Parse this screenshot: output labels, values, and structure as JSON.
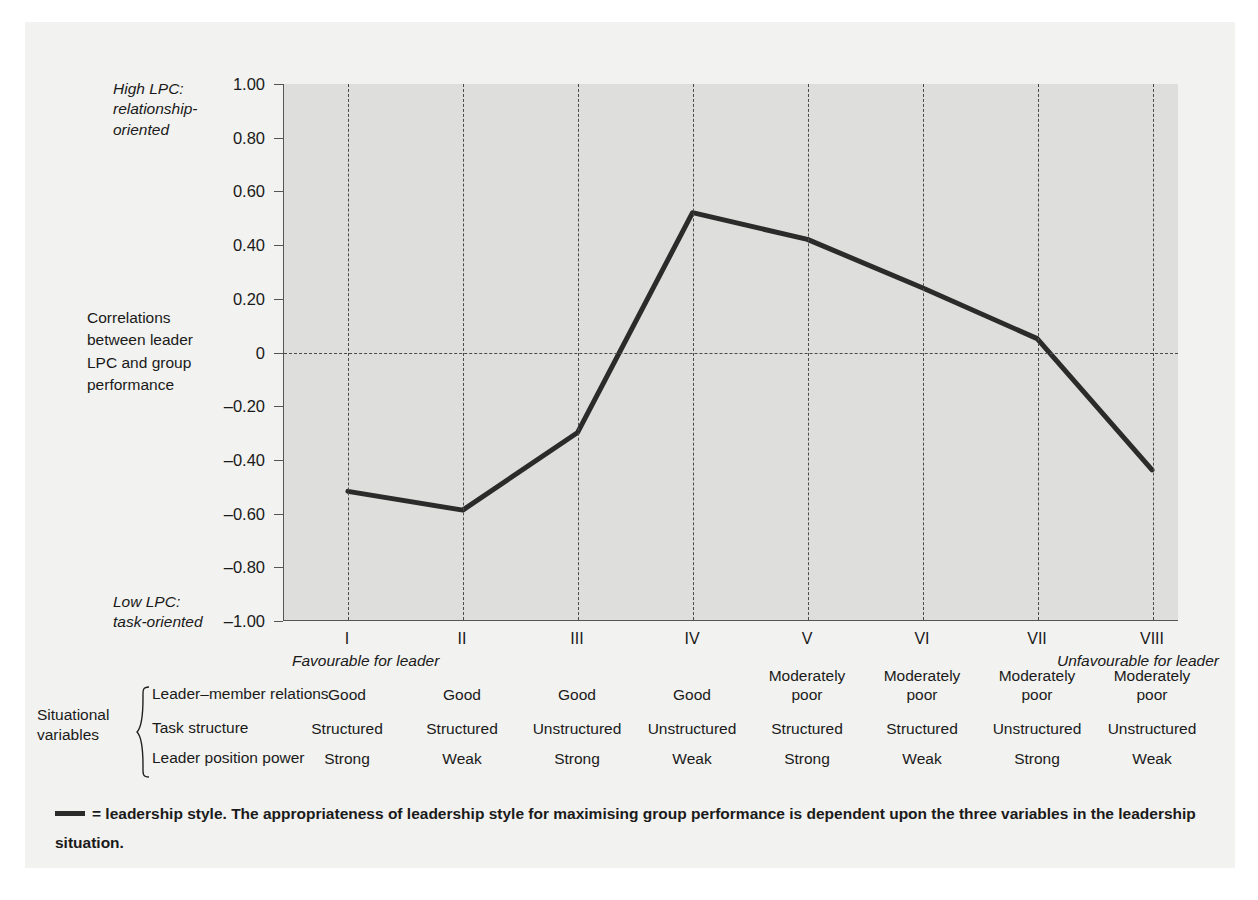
{
  "chart_data": {
    "type": "line",
    "title": "",
    "xlabel": "",
    "ylabel": "Correlations between leader LPC and group performance",
    "categories": [
      "I",
      "II",
      "III",
      "IV",
      "V",
      "VI",
      "VII",
      "VIII"
    ],
    "series": [
      {
        "name": "leadership style",
        "values": [
          -0.52,
          -0.59,
          -0.3,
          0.52,
          0.42,
          0.24,
          0.05,
          -0.44
        ]
      }
    ],
    "ylim": [
      -1.0,
      1.0
    ],
    "yticks": [
      "1.00",
      "0.80",
      "0.60",
      "0.40",
      "0.20",
      "0",
      "-0.20",
      "-0.40",
      "-0.60",
      "-0.80",
      "-1.00"
    ],
    "ytick_values": [
      1.0,
      0.8,
      0.6,
      0.4,
      0.2,
      0,
      -0.2,
      -0.4,
      -0.6,
      -0.8,
      -1.0
    ],
    "grid": "vertical dashed at each category, horizontal dashed at zero",
    "legend": "none",
    "annotations": {
      "y_top": "High LPC:\nrelationship-\noriented",
      "y_middle": "Correlations\nbetween leader\nLPC and group\nperformance",
      "y_bottom": "Low LPC:\ntask-oriented",
      "x_left": "Favourable for leader",
      "x_right": "Unfavourable for leader"
    },
    "line_color": "#2b2b2b",
    "plot_background": "#dededc"
  },
  "axis": {
    "y_top_note": "High LPC:\nrelationship-\noriented",
    "y_mid_note": "Correlations\nbetween leader\nLPC and group\nperformance",
    "y_bottom_note": "Low LPC:\ntask-oriented",
    "x_left_note": "Favourable for leader",
    "x_right_note": "Unfavourable for leader",
    "y_tick_labels": [
      "1.00",
      "0.80",
      "0.60",
      "0.40",
      "0.20",
      "0",
      "-0.20",
      "-0.40",
      "-0.60",
      "-0.80",
      "-1.00"
    ],
    "x_tick_labels": [
      "I",
      "II",
      "III",
      "IV",
      "V",
      "VI",
      "VII",
      "VIII"
    ]
  },
  "situational_variables": {
    "title": "Situational\nvariables",
    "row_labels": [
      "Leader-member relations",
      "Task structure",
      "Leader position power"
    ],
    "rows": [
      [
        "Good",
        "Good",
        "Good",
        "Good",
        "Moderately\npoor",
        "Moderately\npoor",
        "Moderately\npoor",
        "Moderately\npoor"
      ],
      [
        "Structured",
        "Structured",
        "Unstructured",
        "Unstructured",
        "Structured",
        "Structured",
        "Unstructured",
        "Unstructured"
      ],
      [
        "Strong",
        "Weak",
        "Strong",
        "Weak",
        "Strong",
        "Weak",
        "Strong",
        "Weak"
      ]
    ]
  },
  "caption": {
    "text": "= leadership style.   The appropriateness of leadership style for maximising group performance is dependent upon the three variables in the leadership situation."
  },
  "colors": {
    "panel_background": "#f2f2f0",
    "plot_background": "#dededc",
    "line": "#2b2b2b",
    "grid": "#4a4a4a",
    "text": "#1a1a1a"
  }
}
